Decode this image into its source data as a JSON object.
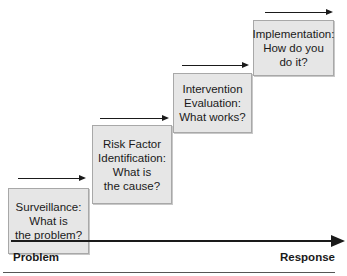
{
  "diagram": {
    "type": "staircase-process",
    "steps": [
      {
        "lines": [
          "Surveillance:",
          "What is",
          "the problem?"
        ]
      },
      {
        "lines": [
          "Risk Factor",
          "Identification:",
          "What is",
          "the cause?"
        ]
      },
      {
        "lines": [
          "Intervention",
          "Evaluation:",
          "What works?"
        ]
      },
      {
        "lines": [
          "Implementation:",
          "How do you",
          "do it?"
        ]
      }
    ],
    "axis": {
      "start_label": "Problem",
      "end_label": "Response"
    },
    "colors": {
      "box_fill": "#e6e6e6",
      "box_border": "#a8a8a8",
      "arrow": "#1a1a1a"
    }
  }
}
